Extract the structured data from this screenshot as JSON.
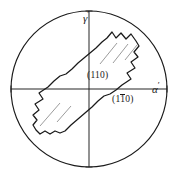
{
  "figure": {
    "type": "stereographic-projection-diagram",
    "background_color": "#ffffff",
    "line_color": "#1a1a1a"
  },
  "circle": {
    "name": "reference-circle",
    "center_x": 89,
    "center_y": 89,
    "radius": 78
  },
  "axes": {
    "horizontal": {
      "label": "α",
      "prime": "′",
      "y": 89,
      "x_start": 11,
      "x_end": 167,
      "tick_left_x": 11,
      "tick_right_x": 167
    },
    "vertical": {
      "label": "γ",
      "prime": "′",
      "x": 89,
      "y_start": 11,
      "y_end": 167,
      "tick_top_y": 11,
      "tick_bottom_y": 167
    }
  },
  "labels": {
    "alpha_prime": "α",
    "alpha_prime_mark": "′",
    "gamma_prime": "γ",
    "gamma_prime_mark": "′",
    "plane_110_open": "(",
    "plane_110_digits": "110",
    "plane_110_close": ")",
    "plane_1b10_open": "(",
    "plane_1b10_d1": "1",
    "plane_1b10_d2_bar": "1",
    "plane_1b10_d3": "0",
    "plane_1b10_close": ")"
  },
  "band": {
    "name": "lath-shaped-grain-outline",
    "description": "elongated band running lower-left to upper-right with serrated stepped ends",
    "outline_points": "112,32 116,38 121,33 126,39 131,34 136,41 139,46 134,52 138,57 131,62 135,68 127,73 131,79 122,85 117,92 112,95 106,95 100,101 96,106 86,113 79,119 73,124 68,130 62,133 57,131 52,134 46,131 41,134 37,130 34,125 38,120 34,115 40,110 36,104 44,99 40,93 49,87 54,80 59,77 65,77 71,71 75,66 85,59 92,53 98,48 103,42 108,39",
    "lower_left_edge": "34,125 98,48",
    "upper_right_edge": "62,133 139,46"
  },
  "leader_lines": [
    {
      "name": "leader-line-1",
      "x1": 100,
      "y1": 63,
      "x2": 116,
      "y2": 43
    },
    {
      "name": "leader-line-2",
      "x1": 113,
      "y1": 62,
      "x2": 128,
      "y2": 43
    },
    {
      "name": "leader-line-3",
      "x1": 125,
      "y1": 59,
      "x2": 137,
      "y2": 44
    },
    {
      "name": "leader-line-4",
      "x1": 40,
      "y1": 125,
      "x2": 59,
      "y2": 103
    },
    {
      "name": "leader-line-5",
      "x1": 57,
      "y1": 121,
      "x2": 70,
      "y2": 106
    }
  ]
}
